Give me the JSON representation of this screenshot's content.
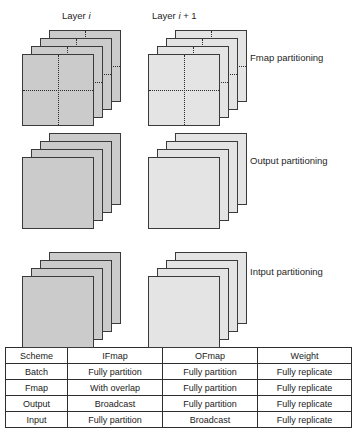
{
  "headers": {
    "left": {
      "prefix": "Layer ",
      "var": "i",
      "suffix": ""
    },
    "right": {
      "prefix": "Layer ",
      "var": "i",
      "suffix": " + 1"
    }
  },
  "rows": [
    {
      "id": "fmap",
      "caption": "Fmap partitioning",
      "sheets_per_stack": 4,
      "left_partitioned": true,
      "right_partitioned": true
    },
    {
      "id": "output",
      "caption": "Output partitioning",
      "sheets_per_stack": 4,
      "left_partitioned": false,
      "right_partitioned": false
    },
    {
      "id": "input",
      "caption": "Intput partitioning",
      "sheets_per_stack": 4,
      "left_partitioned": false,
      "right_partitioned": false
    }
  ],
  "table": {
    "columns": [
      "Scheme",
      "IFmap",
      "OFmap",
      "Weight"
    ],
    "rows": [
      {
        "scheme": "Batch",
        "ifmap": "Fully partition",
        "ofmap": "Fully partition",
        "weight": "Fully replicate"
      },
      {
        "scheme": "Fmap",
        "ifmap": "With overlap",
        "ofmap": "Fully partition",
        "weight": "Fully replicate"
      },
      {
        "scheme": "Output",
        "ifmap": "Broadcast",
        "ofmap": "Fully partition",
        "weight": "Fully replicate"
      },
      {
        "scheme": "Input",
        "ifmap": "Fully partition",
        "ofmap": "Broadcast",
        "weight": "Fully replicate"
      }
    ]
  },
  "colors": {
    "left_sheet_fill": "#cbcbcb",
    "right_sheet_fill": "#e4e4e4",
    "sheet_border": "#3a3a3a",
    "divider": "#2b2b2b",
    "table_border": "#2e2e2e",
    "background": "#ffffff"
  }
}
